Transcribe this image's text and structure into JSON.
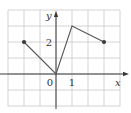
{
  "chart_data": {
    "type": "line",
    "title": "",
    "xlabel": "x",
    "ylabel": "y",
    "xlim": [
      -3,
      4
    ],
    "ylim": [
      -2,
      4
    ],
    "grid": true,
    "tick_labels": {
      "x": [
        {
          "value": 0,
          "label": "0"
        },
        {
          "value": 1,
          "label": "1"
        }
      ],
      "y": [
        {
          "value": 2,
          "label": "2"
        }
      ]
    },
    "series": [
      {
        "name": "f",
        "points": [
          [
            -2,
            2
          ],
          [
            0,
            0
          ],
          [
            1,
            3
          ],
          [
            3,
            2
          ]
        ],
        "endpoints_marked": [
          [
            -2,
            2
          ],
          [
            3,
            2
          ]
        ]
      }
    ]
  }
}
